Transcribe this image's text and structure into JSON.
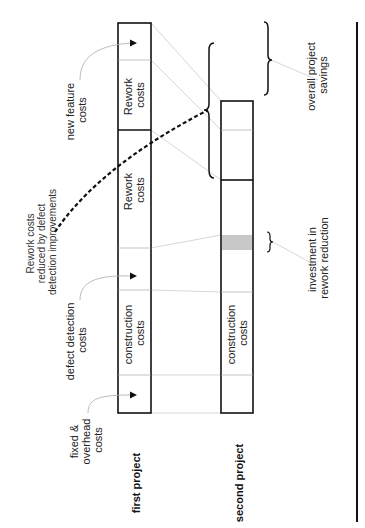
{
  "diagram": {
    "orientation": "rotated-90-ccw",
    "projects": [
      {
        "name": "first project",
        "segments": [
          {
            "label": "fixed & overhead costs",
            "text_in_box": ""
          },
          {
            "label": "construction costs",
            "text_in_box": "construction costs"
          },
          {
            "label": "defect detection costs",
            "text_in_box": ""
          },
          {
            "label": "Rework costs",
            "text_in_box": "Rework costs"
          },
          {
            "label": "new feature costs",
            "text_in_box": ""
          },
          {
            "label": "Rework costs (new feature)",
            "text_in_box": "Rework costs"
          }
        ]
      },
      {
        "name": "second project",
        "segments": [
          {
            "label": "fixed & overhead costs",
            "text_in_box": ""
          },
          {
            "label": "construction costs",
            "text_in_box": "construction costs"
          },
          {
            "label": "defect detection costs",
            "text_in_box": ""
          },
          {
            "label": "investment in rework reduction",
            "text_in_box": "",
            "fill": "#c8c8c8"
          },
          {
            "label": "Rework costs (reduced)",
            "text_in_box": ""
          },
          {
            "label": "new feature costs",
            "text_in_box": ""
          }
        ]
      }
    ],
    "labels": {
      "first_project": "first project",
      "second_project": "second project",
      "fixed_overhead_line1": "fixed &",
      "fixed_overhead_line2": "overhead",
      "fixed_overhead_line3": "costs",
      "defect_detection_line1": "defect detection",
      "defect_detection_line2": "costs",
      "new_feature_line1": "new feature",
      "new_feature_line2": "costs",
      "rework_reduced_line1": "Rework costs",
      "rework_reduced_line2": "reduced by defect",
      "rework_reduced_line3": "detection improvements",
      "construction_line1": "construction",
      "construction_line2": "costs",
      "rework_line1": "Rework",
      "rework_line2": "costs",
      "investment_line1": "investment in",
      "investment_line2": "rework reduction",
      "savings_line1": "overall project",
      "savings_line2": "savings"
    },
    "colors": {
      "stroke": "#111111",
      "guide": "#bbbbbb",
      "investment_fill": "#c8c8c8"
    }
  }
}
